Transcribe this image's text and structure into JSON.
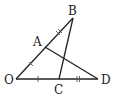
{
  "diagram": {
    "type": "geometry",
    "points": {
      "O": {
        "label": "O",
        "x": 16,
        "y": 79
      },
      "A": {
        "label": "A",
        "x": 45,
        "y": 47
      },
      "B": {
        "label": "B",
        "x": 73,
        "y": 18
      },
      "C": {
        "label": "C",
        "x": 59,
        "y": 79
      },
      "D": {
        "label": "D",
        "x": 98,
        "y": 79
      }
    },
    "segments": [
      "OB",
      "OD",
      "BC",
      "AD"
    ],
    "tick_marks": {
      "single": [
        "OA",
        "OC"
      ],
      "double": [
        "AB",
        "CD"
      ]
    },
    "line_color": "#222222"
  }
}
